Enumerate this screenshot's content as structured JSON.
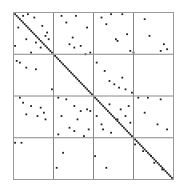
{
  "chart_data": {
    "type": "scatter",
    "subtype": "sparse-matrix-spy-plot",
    "title": "",
    "xlabel": "",
    "ylabel": "",
    "grid": "4x4 block partition",
    "xlim": [
      0,
      100
    ],
    "ylim": [
      0,
      100
    ],
    "y_axis_direction": "down",
    "block_boundaries": [
      25,
      50,
      75
    ],
    "colors": {
      "points": "#222222",
      "grid": "#888888",
      "frame": "#9a9a9a",
      "background": "#ffffff"
    },
    "diagonal": {
      "from": [
        0,
        0
      ],
      "to": [
        100,
        100
      ],
      "description": "dense main diagonal band of nonzeros"
    },
    "points": [
      [
        1,
        1
      ],
      [
        2,
        2
      ],
      [
        3,
        3
      ],
      [
        4,
        4
      ],
      [
        5,
        5
      ],
      [
        6,
        6
      ],
      [
        7,
        7
      ],
      [
        8,
        8
      ],
      [
        9,
        9
      ],
      [
        10,
        10
      ],
      [
        11,
        11
      ],
      [
        12,
        12
      ],
      [
        13,
        13
      ],
      [
        14,
        14
      ],
      [
        15,
        15
      ],
      [
        16,
        16
      ],
      [
        17,
        17
      ],
      [
        18,
        18
      ],
      [
        19,
        19
      ],
      [
        20,
        20
      ],
      [
        21,
        21
      ],
      [
        22,
        22
      ],
      [
        23,
        23
      ],
      [
        24,
        24
      ],
      [
        26,
        26
      ],
      [
        27,
        27
      ],
      [
        28,
        28
      ],
      [
        29,
        29
      ],
      [
        30,
        30
      ],
      [
        31,
        31
      ],
      [
        32,
        32
      ],
      [
        33,
        33
      ],
      [
        34,
        34
      ],
      [
        35,
        35
      ],
      [
        36,
        36
      ],
      [
        37,
        37
      ],
      [
        38,
        38
      ],
      [
        39,
        39
      ],
      [
        40,
        40
      ],
      [
        41,
        41
      ],
      [
        42,
        42
      ],
      [
        43,
        43
      ],
      [
        44,
        44
      ],
      [
        45,
        45
      ],
      [
        46,
        46
      ],
      [
        47,
        47
      ],
      [
        48,
        48
      ],
      [
        49,
        49
      ],
      [
        51,
        51
      ],
      [
        52,
        52
      ],
      [
        53,
        53
      ],
      [
        54,
        54
      ],
      [
        55,
        55
      ],
      [
        56,
        56
      ],
      [
        57,
        57
      ],
      [
        58,
        58
      ],
      [
        59,
        59
      ],
      [
        60,
        60
      ],
      [
        61,
        61
      ],
      [
        62,
        62
      ],
      [
        63,
        63
      ],
      [
        64,
        64
      ],
      [
        65,
        65
      ],
      [
        66,
        66
      ],
      [
        67,
        67
      ],
      [
        68,
        68
      ],
      [
        69,
        69
      ],
      [
        70,
        70
      ],
      [
        71,
        71
      ],
      [
        72,
        72
      ],
      [
        73,
        73
      ],
      [
        74,
        74
      ],
      [
        76,
        76
      ],
      [
        77,
        77
      ],
      [
        78,
        78
      ],
      [
        79,
        79
      ],
      [
        80,
        80
      ],
      [
        81,
        81
      ],
      [
        82,
        82
      ],
      [
        83,
        83
      ],
      [
        84,
        84
      ],
      [
        85,
        85
      ],
      [
        86,
        86
      ],
      [
        87,
        87
      ],
      [
        88,
        88
      ],
      [
        89,
        89
      ],
      [
        90,
        90
      ],
      [
        91,
        91
      ],
      [
        92,
        92
      ],
      [
        93,
        93
      ],
      [
        94,
        94
      ],
      [
        95,
        95
      ],
      [
        96,
        96
      ],
      [
        97,
        97
      ],
      [
        98,
        98
      ],
      [
        99,
        99
      ],
      [
        6,
        2
      ],
      [
        9,
        1
      ],
      [
        13,
        3
      ],
      [
        18,
        8
      ],
      [
        20,
        14
      ],
      [
        22,
        16
      ],
      [
        3,
        9
      ],
      [
        1,
        20
      ],
      [
        8,
        16
      ],
      [
        11,
        24
      ],
      [
        14,
        18
      ],
      [
        17,
        21
      ],
      [
        21,
        12
      ],
      [
        30,
        2
      ],
      [
        33,
        6
      ],
      [
        39,
        2
      ],
      [
        46,
        9
      ],
      [
        42,
        20
      ],
      [
        38,
        21
      ],
      [
        37,
        15
      ],
      [
        45,
        25
      ],
      [
        48,
        24
      ],
      [
        35,
        19
      ],
      [
        55,
        3
      ],
      [
        61,
        1
      ],
      [
        68,
        1
      ],
      [
        58,
        7
      ],
      [
        64,
        16
      ],
      [
        65,
        17
      ],
      [
        71,
        13
      ],
      [
        73,
        23
      ],
      [
        75,
        24
      ],
      [
        82,
        4
      ],
      [
        85,
        14
      ],
      [
        94,
        19
      ],
      [
        96,
        22
      ],
      [
        92,
        23
      ],
      [
        2,
        29
      ],
      [
        4,
        30
      ],
      [
        8,
        33
      ],
      [
        14,
        34
      ],
      [
        24,
        46
      ],
      [
        4,
        51
      ],
      [
        6,
        54
      ],
      [
        8,
        61
      ],
      [
        11,
        56
      ],
      [
        15,
        62
      ],
      [
        17,
        57
      ],
      [
        19,
        60
      ],
      [
        20,
        64
      ],
      [
        28,
        51
      ],
      [
        33,
        52
      ],
      [
        38,
        56
      ],
      [
        42,
        59
      ],
      [
        46,
        58
      ],
      [
        48,
        59
      ],
      [
        30,
        62
      ],
      [
        40,
        64
      ],
      [
        35,
        69
      ],
      [
        47,
        70
      ],
      [
        28,
        73
      ],
      [
        44,
        74
      ],
      [
        38,
        71
      ],
      [
        52,
        30
      ],
      [
        60,
        41
      ],
      [
        66,
        45
      ],
      [
        70,
        46
      ],
      [
        74,
        48
      ],
      [
        68,
        39
      ],
      [
        57,
        35
      ],
      [
        63,
        43
      ],
      [
        60,
        55
      ],
      [
        67,
        58
      ],
      [
        72,
        56
      ],
      [
        70,
        62
      ],
      [
        65,
        64
      ],
      [
        56,
        70
      ],
      [
        61,
        72
      ],
      [
        73,
        66
      ],
      [
        52,
        62
      ],
      [
        55,
        67
      ],
      [
        78,
        51
      ],
      [
        84,
        51
      ],
      [
        92,
        52
      ],
      [
        82,
        60
      ],
      [
        90,
        67
      ],
      [
        96,
        70
      ],
      [
        1,
        78
      ],
      [
        5,
        78
      ],
      [
        31,
        84
      ],
      [
        51,
        86
      ],
      [
        27,
        93
      ],
      [
        58,
        93
      ],
      [
        76,
        79
      ],
      [
        81,
        83
      ],
      [
        86,
        86
      ],
      [
        88,
        90
      ],
      [
        93,
        94
      ]
    ]
  }
}
